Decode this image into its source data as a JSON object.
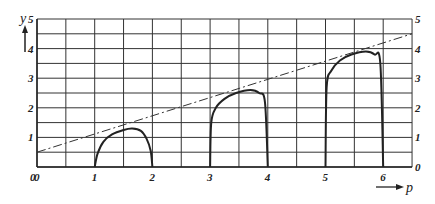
{
  "chart_data": {
    "type": "line",
    "title": "",
    "xlabel": "p",
    "ylabel": "y",
    "xlim": [
      0,
      6.5
    ],
    "ylim": [
      0,
      5
    ],
    "grid": true,
    "grid_step": 0.5,
    "x_ticks": [
      "0",
      "1",
      "2",
      "3",
      "4",
      "5",
      "6"
    ],
    "y_ticks_left": [
      "0",
      "1",
      "2",
      "3",
      "4",
      "5"
    ],
    "y_ticks_right": [
      "0",
      "1",
      "2",
      "3",
      "4",
      "5"
    ],
    "series": [
      {
        "name": "dashed line",
        "style": "dash-dot",
        "x": [
          0,
          6.5
        ],
        "y": [
          0.5,
          4.5
        ]
      },
      {
        "name": "arch 1",
        "style": "solid",
        "x": [
          1.0,
          1.05,
          1.15,
          1.3,
          1.5,
          1.65,
          1.8,
          1.9,
          1.97,
          2.0
        ],
        "y": [
          0.0,
          0.45,
          0.85,
          1.1,
          1.25,
          1.3,
          1.22,
          0.95,
          0.55,
          0.0
        ]
      },
      {
        "name": "arch 2",
        "style": "solid",
        "x": [
          3.0,
          3.02,
          3.1,
          3.25,
          3.45,
          3.7,
          3.85,
          3.95,
          4.0
        ],
        "y": [
          0.0,
          1.5,
          2.0,
          2.3,
          2.5,
          2.6,
          2.5,
          2.2,
          0.0
        ]
      },
      {
        "name": "arch 3",
        "style": "solid",
        "x": [
          5.0,
          5.02,
          5.1,
          5.25,
          5.45,
          5.7,
          5.85,
          5.95,
          6.0
        ],
        "y": [
          0.0,
          2.7,
          3.25,
          3.6,
          3.8,
          3.9,
          3.8,
          3.5,
          0.0
        ]
      }
    ]
  },
  "axes": {
    "x_label": "p",
    "y_label": "y",
    "x_ticks": [
      "0",
      "1",
      "2",
      "3",
      "4",
      "5",
      "6"
    ],
    "y_left": [
      "0",
      "1",
      "2",
      "3",
      "4",
      "5"
    ],
    "y_right": [
      "0",
      "1",
      "2",
      "3",
      "4",
      "5"
    ]
  }
}
